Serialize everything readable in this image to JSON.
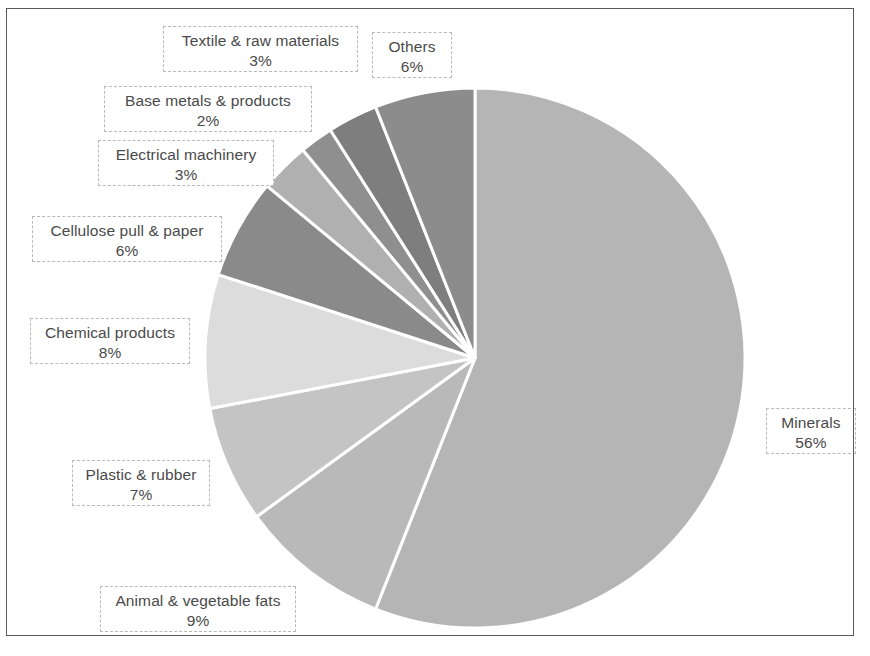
{
  "figure": {
    "frame_color": "#5b5b5b",
    "background": "#ffffff",
    "label_text_color": "#4a4a4a",
    "label_border_color": "#b9b9b9",
    "slice_separator_color": "#ffffff"
  },
  "chart_data": {
    "type": "pie",
    "title": "",
    "subtitle": "",
    "xlabel": "",
    "ylabel": "",
    "units": "percent",
    "grid": false,
    "legend_position": "none",
    "label_format": "category name and percentage in dashed callout boxes",
    "start_angle_deg": 0,
    "direction": "clockwise",
    "total": 100,
    "center": {
      "x": 475,
      "y": 358
    },
    "radius": 270,
    "categories": [
      "Minerals",
      "Animal & vegetable fats",
      "Plastic & rubber",
      "Chemical products",
      "Cellulose pull & paper",
      "Electrical machinery",
      "Base metals & products",
      "Textile & raw materials",
      "Others"
    ],
    "values": [
      56,
      9,
      7,
      8,
      6,
      3,
      2,
      3,
      6
    ],
    "slices": [
      {
        "name": "Minerals",
        "value": 56,
        "label": "Minerals",
        "percent": "56%",
        "color": "#b5b5b5",
        "start_deg": 0,
        "end_deg": 201.6
      },
      {
        "name": "Animal & vegetable fats",
        "value": 9,
        "label": "Animal & vegetable fats",
        "percent": "9%",
        "color": "#b9b9b9",
        "start_deg": 201.6,
        "end_deg": 234.0
      },
      {
        "name": "Plastic & rubber",
        "value": 7,
        "label": "Plastic & rubber",
        "percent": "7%",
        "color": "#c4c4c4",
        "start_deg": 234.0,
        "end_deg": 259.2
      },
      {
        "name": "Chemical products",
        "value": 8,
        "label": "Chemical products",
        "percent": "8%",
        "color": "#dcdcdc",
        "start_deg": 259.2,
        "end_deg": 288.0
      },
      {
        "name": "Cellulose pull & paper",
        "value": 6,
        "label": "Cellulose pull & paper",
        "percent": "6%",
        "color": "#8a8a8a",
        "start_deg": 288.0,
        "end_deg": 309.6
      },
      {
        "name": "Electrical machinery",
        "value": 3,
        "label": "Electrical machinery",
        "percent": "3%",
        "color": "#b0b0b0",
        "start_deg": 309.6,
        "end_deg": 320.4
      },
      {
        "name": "Base metals & products",
        "value": 2,
        "label": "Base metals & products",
        "percent": "2%",
        "color": "#8f8f8f",
        "start_deg": 320.4,
        "end_deg": 327.6
      },
      {
        "name": "Textile & raw materials",
        "value": 3,
        "label": "Textile & raw materials",
        "percent": "3%",
        "color": "#7e7e7e",
        "start_deg": 327.6,
        "end_deg": 338.4
      },
      {
        "name": "Others",
        "value": 6,
        "label": "Others",
        "percent": "6%",
        "color": "#8c8c8c",
        "start_deg": 338.4,
        "end_deg": 360.0
      }
    ]
  },
  "callouts": [
    {
      "label": "Textile & raw materials",
      "percent": "3%",
      "x": 163,
      "y": 26,
      "w": 195,
      "h": 46
    },
    {
      "label": "Others",
      "percent": "6%",
      "x": 372,
      "y": 32,
      "w": 80,
      "h": 46
    },
    {
      "label": "Base metals & products",
      "percent": "2%",
      "x": 104,
      "y": 86,
      "w": 208,
      "h": 46
    },
    {
      "label": "Electrical machinery",
      "percent": "3%",
      "x": 98,
      "y": 140,
      "w": 176,
      "h": 46
    },
    {
      "label": "Cellulose pull & paper",
      "percent": "6%",
      "x": 32,
      "y": 216,
      "w": 190,
      "h": 46
    },
    {
      "label": "Chemical products",
      "percent": "8%",
      "x": 30,
      "y": 318,
      "w": 160,
      "h": 46
    },
    {
      "label": "Minerals",
      "percent": "56%",
      "x": 766,
      "y": 408,
      "w": 90,
      "h": 46
    },
    {
      "label": "Plastic & rubber",
      "percent": "7%",
      "x": 72,
      "y": 460,
      "w": 138,
      "h": 46
    },
    {
      "label": "Animal & vegetable fats",
      "percent": "9%",
      "x": 100,
      "y": 586,
      "w": 196,
      "h": 46
    }
  ]
}
